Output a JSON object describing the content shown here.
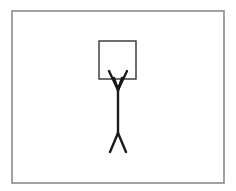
{
  "figure": {
    "colors": {
      "background": "#ffffff",
      "frame_stroke": "#8a8a8a",
      "box_stroke": "#333333",
      "figure_stroke": "#1a1a1a"
    },
    "frame": {
      "x": 12,
      "y": 11,
      "width": 212,
      "height": 172
    },
    "box": {
      "x": 99,
      "y": 41,
      "width": 37,
      "height": 38
    },
    "figure": {
      "left_arm": {
        "x1": 109,
        "y1": 71,
        "x2": 118,
        "y2": 90
      },
      "right_arm": {
        "x1": 127,
        "y1": 71,
        "x2": 118,
        "y2": 90
      },
      "inner_left": {
        "x1": 114,
        "y1": 78,
        "x2": 118,
        "y2": 90
      },
      "inner_right": {
        "x1": 122,
        "y1": 78,
        "x2": 118,
        "y2": 90
      },
      "torso": {
        "x1": 118,
        "y1": 86,
        "x2": 118,
        "y2": 133
      },
      "left_leg": {
        "x1": 118,
        "y1": 133,
        "x2": 110,
        "y2": 152
      },
      "right_leg": {
        "x1": 118,
        "y1": 133,
        "x2": 126,
        "y2": 152
      }
    }
  }
}
